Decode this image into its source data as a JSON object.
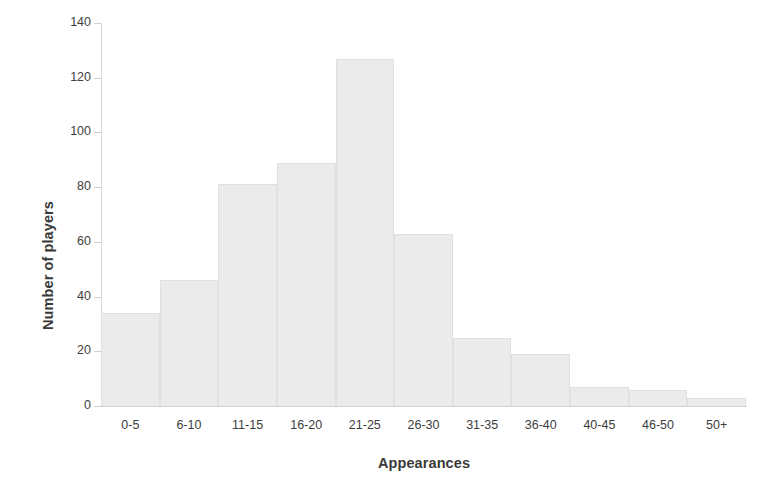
{
  "chart_data": {
    "type": "bar",
    "title": "",
    "subtitle": "",
    "xlabel": "Appearances",
    "ylabel": "Number of players",
    "categories": [
      "0-5",
      "6-10",
      "11-15",
      "16-20",
      "21-25",
      "26-30",
      "31-35",
      "36-40",
      "40-45",
      "46-50",
      "50+"
    ],
    "values": [
      34,
      46,
      81,
      89,
      127,
      63,
      25,
      19,
      7,
      6,
      3
    ],
    "ylim": [
      0,
      140
    ],
    "ytick_labels": [
      "0",
      "20",
      "40",
      "60",
      "80",
      "100",
      "120",
      "140"
    ],
    "ytick_values": [
      0,
      20,
      40,
      60,
      80,
      100,
      120,
      140
    ],
    "grid": false,
    "legend": "none",
    "bar_color": "#ebebeb",
    "bar_edge_color": "#e0e0e0",
    "axis_color": "#d6d6d6",
    "text_color": "#3d3d3d",
    "title_color": "#3a3a3a"
  }
}
